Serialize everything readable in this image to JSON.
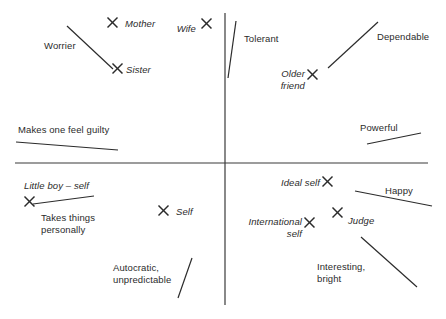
{
  "figure": {
    "type": "repertory-grid-scatter",
    "background_color": "#ffffff",
    "ink_color": "#2b2b2b",
    "axis": {
      "name": "principal-component-axes",
      "vertical_x": 225,
      "vertical_y1": 13,
      "vertical_y2": 305,
      "horizontal_y": 163,
      "horizontal_x1": 15,
      "horizontal_x2": 428
    }
  },
  "elements": [
    {
      "label": "Mother",
      "x": 112,
      "y": 22,
      "label_x": 125,
      "label_y": 18,
      "align": "left",
      "lines": [
        "Mother"
      ]
    },
    {
      "label": "Wife",
      "x": 206,
      "y": 23,
      "label_x": 196,
      "label_y": 23,
      "align": "right",
      "lines": [
        "Wife"
      ]
    },
    {
      "label": "Sister",
      "x": 117,
      "y": 68,
      "label_x": 126,
      "label_y": 64,
      "align": "left",
      "lines": [
        "Sister"
      ]
    },
    {
      "label": "Older friend",
      "x": 312,
      "y": 74,
      "label_x": 305,
      "label_y": 68,
      "align": "right",
      "lines": [
        "Older",
        "friend"
      ]
    },
    {
      "label": "Little boy – self",
      "x": 29,
      "y": 201,
      "label_x": 24,
      "label_y": 180,
      "align": "left",
      "lines": [
        "Little boy – self"
      ]
    },
    {
      "label": "Self",
      "x": 163,
      "y": 210,
      "label_x": 176,
      "label_y": 206,
      "align": "left",
      "lines": [
        "Self"
      ]
    },
    {
      "label": "Ideal self",
      "x": 327,
      "y": 181,
      "label_x": 320,
      "label_y": 177,
      "align": "right",
      "lines": [
        "Ideal self"
      ]
    },
    {
      "label": "Judge",
      "x": 337,
      "y": 212,
      "label_x": 348,
      "label_y": 215,
      "align": "left",
      "lines": [
        "Judge"
      ]
    },
    {
      "label": "International self",
      "x": 309,
      "y": 222,
      "label_x": 302,
      "label_y": 216,
      "align": "right",
      "lines": [
        "International",
        "self"
      ]
    }
  ],
  "constructs": [
    {
      "label": "Worrier",
      "label_x": 44,
      "label_y": 40,
      "line": {
        "x1": 67,
        "y1": 26,
        "x2": 113,
        "y2": 69
      },
      "lines": [
        "Worrier"
      ]
    },
    {
      "label": "Tolerant",
      "label_x": 244,
      "label_y": 33,
      "line": {
        "x1": 236,
        "y1": 21,
        "x2": 228,
        "y2": 78
      },
      "lines": [
        "Tolerant"
      ]
    },
    {
      "label": "Dependable",
      "label_x": 377,
      "label_y": 31,
      "line": {
        "x1": 328,
        "y1": 68,
        "x2": 378,
        "y2": 22
      },
      "lines": [
        "Dependable"
      ]
    },
    {
      "label": "Makes one feel guilty",
      "label_x": 18,
      "label_y": 124,
      "line": {
        "x1": 16,
        "y1": 142,
        "x2": 118,
        "y2": 150
      },
      "lines": [
        "Makes one feel guilty"
      ]
    },
    {
      "label": "Powerful",
      "label_x": 360,
      "label_y": 122,
      "line": {
        "x1": 367,
        "y1": 144,
        "x2": 421,
        "y2": 133
      },
      "lines": [
        "Powerful"
      ]
    },
    {
      "label": "Takes things personally",
      "label_x": 41,
      "label_y": 212,
      "line": {
        "x1": 33,
        "y1": 204,
        "x2": 94,
        "y2": 196
      },
      "lines": [
        "Takes things",
        "personally"
      ]
    },
    {
      "label": "Happy",
      "label_x": 385,
      "label_y": 185,
      "line": {
        "x1": 355,
        "y1": 191,
        "x2": 432,
        "y2": 206
      },
      "lines": [
        "Happy"
      ]
    },
    {
      "label": "Autocratic, unpredictable",
      "label_x": 113,
      "label_y": 262,
      "line": {
        "x1": 178,
        "y1": 298,
        "x2": 192,
        "y2": 258
      },
      "lines": [
        "Autocratic,",
        "unpredictable"
      ]
    },
    {
      "label": "Interesting, bright",
      "label_x": 317,
      "label_y": 261,
      "line": {
        "x1": 361,
        "y1": 237,
        "x2": 417,
        "y2": 287
      },
      "lines": [
        "Interesting,",
        "bright"
      ]
    }
  ]
}
